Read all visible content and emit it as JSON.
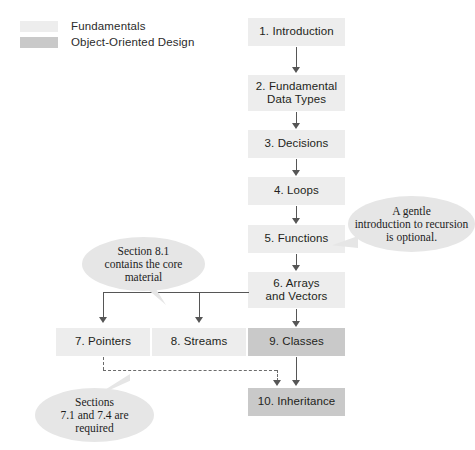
{
  "legend": {
    "items": [
      {
        "label": "Fundamentals",
        "color": "#ededed",
        "swatch_name": "legend-swatch-fundamentals"
      },
      {
        "label": "Object-Oriented Design",
        "color": "#c9c9c9",
        "swatch_name": "legend-swatch-object-oriented-design"
      }
    ]
  },
  "colors": {
    "fundamentals": "#ededed",
    "object_oriented": "#c9c9c9",
    "callout_bg": "#e6e6e6",
    "line": "#565656",
    "text": "#231f20"
  },
  "nodes": [
    {
      "id": "ch1",
      "label": "1. Introduction",
      "category": "Fundamentals"
    },
    {
      "id": "ch2",
      "label": "2. Fundamental\nData Types",
      "category": "Fundamentals"
    },
    {
      "id": "ch3",
      "label": "3. Decisions",
      "category": "Fundamentals"
    },
    {
      "id": "ch4",
      "label": "4. Loops",
      "category": "Fundamentals"
    },
    {
      "id": "ch5",
      "label": "5. Functions",
      "category": "Fundamentals"
    },
    {
      "id": "ch6",
      "label": "6. Arrays\nand Vectors",
      "category": "Fundamentals"
    },
    {
      "id": "ch7",
      "label": "7. Pointers",
      "category": "Fundamentals"
    },
    {
      "id": "ch8",
      "label": "8. Streams",
      "category": "Fundamentals"
    },
    {
      "id": "ch9",
      "label": "9. Classes",
      "category": "Object-Oriented Design"
    },
    {
      "id": "ch10",
      "label": "10. Inheritance",
      "category": "Object-Oriented Design"
    }
  ],
  "callouts": [
    {
      "id": "callout-recursion",
      "text": "A gentle\nintroduction to recursion\nis optional."
    },
    {
      "id": "callout-section-81",
      "text": "Section 8.1\ncontains the core\nmaterial"
    },
    {
      "id": "callout-sections-71-74",
      "text": "Sections\n7.1 and 7.4 are\nrequired"
    }
  ]
}
